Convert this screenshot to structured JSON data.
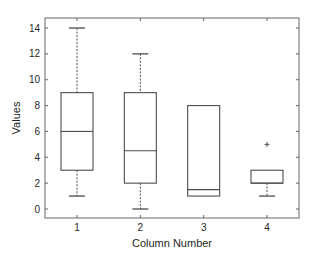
{
  "chart_data": {
    "type": "box",
    "title": "",
    "xlabel": "Column Number",
    "ylabel": "Values",
    "categories": [
      "1",
      "2",
      "3",
      "4"
    ],
    "ylim": [
      -0.6,
      14.8
    ],
    "yticks": [
      0,
      2,
      4,
      6,
      8,
      10,
      12,
      14
    ],
    "grid": false,
    "legend": null,
    "boxes": [
      {
        "label": "1",
        "whisker_low": 1,
        "q1": 3,
        "median": 6,
        "q3": 9,
        "whisker_high": 14,
        "outliers": []
      },
      {
        "label": "2",
        "whisker_low": 0,
        "q1": 2,
        "median": 4.5,
        "q3": 9,
        "whisker_high": 12,
        "outliers": []
      },
      {
        "label": "3",
        "whisker_low": 1,
        "q1": 1,
        "median": 1.5,
        "q3": 8,
        "whisker_high": 8,
        "outliers": []
      },
      {
        "label": "4",
        "whisker_low": 1,
        "q1": 2,
        "median": 2,
        "q3": 3,
        "whisker_high": 3,
        "outliers": [
          5
        ]
      }
    ],
    "colors": {
      "box": "#4d4d4d",
      "axis": "#666666",
      "text": "#262626",
      "background": "#ffffff"
    }
  }
}
